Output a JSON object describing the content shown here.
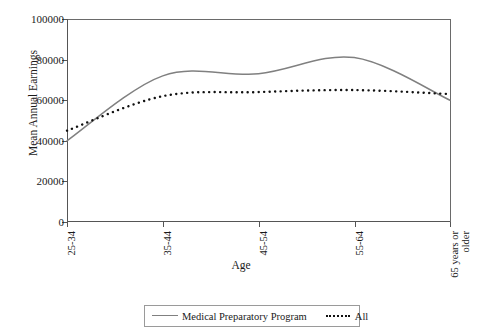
{
  "chart_data": {
    "type": "line",
    "title": "",
    "xlabel": "Age",
    "ylabel": "Mean Annual Earnings",
    "categories": [
      "25-34",
      "35-44",
      "45-54",
      "55-64",
      "65 years or older"
    ],
    "ylim": [
      0,
      100000
    ],
    "yticks": [
      0,
      20000,
      40000,
      60000,
      80000,
      100000
    ],
    "ytick_labels": [
      "0",
      "20000",
      "40000",
      "60000",
      "80000",
      "100000"
    ],
    "grid": false,
    "legend_position": "bottom",
    "series": [
      {
        "name": "Medical Preparatory Program",
        "values": [
          40000,
          72000,
          73000,
          81000,
          60000
        ],
        "color": "#808080",
        "style": "solid"
      },
      {
        "name": "All",
        "values": [
          45000,
          62000,
          64000,
          65000,
          63000
        ],
        "color": "#111111",
        "style": "dotted"
      }
    ]
  },
  "axis": {
    "y_title": "Mean Annual Earnings",
    "x_title": "Age",
    "y_labels": [
      "100000",
      "80000",
      "60000",
      "40000",
      "20000",
      "0"
    ],
    "x_labels": [
      "25-34",
      "35-44",
      "45-54",
      "55-64",
      "65 years or older"
    ]
  },
  "legend": {
    "items": [
      {
        "label": "Medical Preparatory Program",
        "swatch": "solid-gray-line"
      },
      {
        "label": "All",
        "swatch": "dotted-black-line"
      }
    ]
  }
}
